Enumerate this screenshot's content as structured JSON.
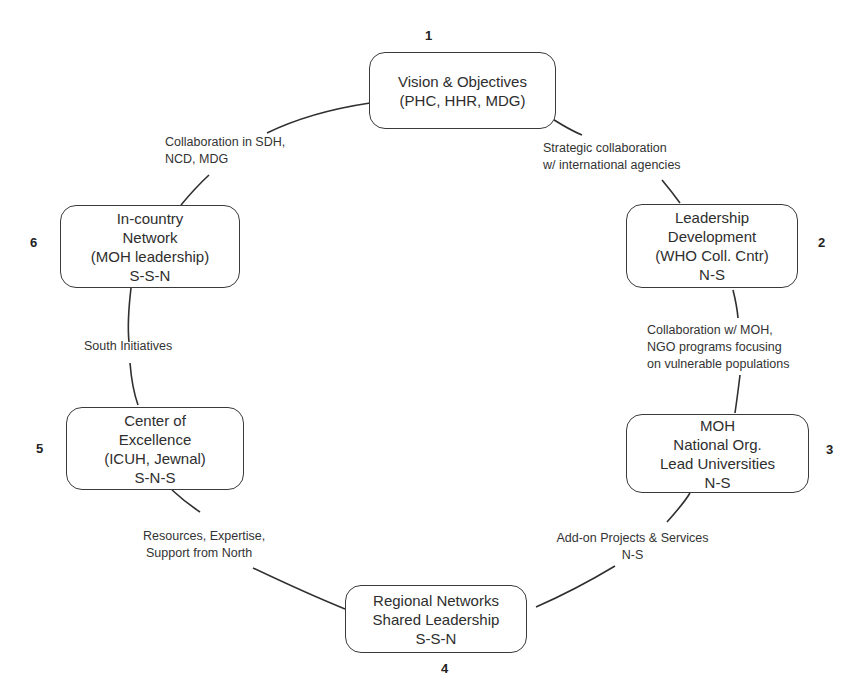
{
  "diagram": {
    "type": "cycle",
    "nodes": [
      {
        "number": "1",
        "lines": [
          "Vision & Objectives",
          "(PHC, HHR, MDG)"
        ]
      },
      {
        "number": "2",
        "lines": [
          "Leadership",
          "Development",
          "(WHO Coll. Cntr)",
          "N-S"
        ]
      },
      {
        "number": "3",
        "lines": [
          "MOH",
          "National Org.",
          "Lead Universities",
          "N-S"
        ]
      },
      {
        "number": "4",
        "lines": [
          "Regional Networks",
          "Shared Leadership",
          "S-S-N"
        ]
      },
      {
        "number": "5",
        "lines": [
          "Center of",
          "Excellence",
          "(ICUH, Jewnal)",
          "S-N-S"
        ]
      },
      {
        "number": "6",
        "lines": [
          "In-country",
          "Network",
          "(MOH leadership)",
          "S-S-N"
        ]
      }
    ],
    "edges": [
      {
        "from": "1",
        "to": "2",
        "lines": [
          "Strategic collaboration",
          "w/ international agencies"
        ]
      },
      {
        "from": "2",
        "to": "3",
        "lines": [
          "Collaboration w/ MOH,",
          "NGO programs focusing",
          "on vulnerable populations"
        ]
      },
      {
        "from": "3",
        "to": "4",
        "lines": [
          "Add-on Projects & Services",
          "N-S"
        ]
      },
      {
        "from": "4",
        "to": "5",
        "lines": [
          "Resources, Expertise,",
          "Support from North"
        ]
      },
      {
        "from": "5",
        "to": "6",
        "lines": [
          "South Initiatives"
        ]
      },
      {
        "from": "6",
        "to": "1",
        "lines": [
          "Collaboration in SDH,",
          "NCD, MDG"
        ]
      }
    ]
  }
}
